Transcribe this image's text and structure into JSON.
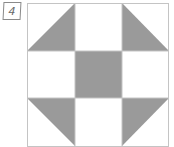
{
  "label": "4",
  "diagram": {
    "type": "quilt-block",
    "grid": {
      "rows": 3,
      "cols": 3,
      "x": 27,
      "y": 3,
      "cell": 47.5
    },
    "colors": {
      "fill": "#9a9a9a",
      "line": "#c4c4c4",
      "background": "#ffffff"
    },
    "cells": [
      [
        "triangle-bottom-right",
        "blank",
        "triangle-bottom-left"
      ],
      [
        "blank",
        "filled",
        "blank"
      ],
      [
        "triangle-top-right",
        "blank",
        "triangle-top-left"
      ]
    ]
  }
}
